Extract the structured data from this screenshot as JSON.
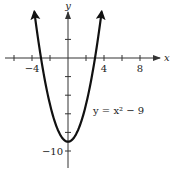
{
  "chart_data": {
    "type": "line",
    "title": "",
    "function": "y = x^2 - 9",
    "annotation": {
      "text": "y = x² − 9",
      "x": 93,
      "y": 114
    },
    "xlabel": "x",
    "ylabel": "y",
    "xlim": [
      -7,
      10
    ],
    "ylim": [
      -12,
      6
    ],
    "x_ticks": [
      -6,
      -4,
      -2,
      2,
      4,
      6,
      8
    ],
    "x_tick_labels": [
      {
        "value": -4,
        "label": "−4"
      },
      {
        "value": 4,
        "label": "4"
      },
      {
        "value": 8,
        "label": "8"
      }
    ],
    "y_ticks": [
      2,
      -2,
      -4,
      -6,
      -8,
      -10
    ],
    "y_tick_labels": [
      {
        "value": -10,
        "label": "−10"
      }
    ],
    "series": [
      {
        "name": "y = x² − 9",
        "x": [
          -3.74,
          -3,
          -2,
          -1,
          0,
          1,
          2,
          3,
          3.74
        ],
        "values": [
          5,
          0,
          -5,
          -8,
          -9,
          -8,
          -5,
          0,
          5
        ],
        "arrows_at_ends": true
      }
    ],
    "vertex": [
      0,
      -9
    ],
    "x_intercepts": [
      -3,
      3
    ],
    "grid": false,
    "legend": "none",
    "colors": {
      "curve": "#111111",
      "axes": "#333333"
    }
  },
  "layout": {
    "origin_px": [
      68,
      58
    ],
    "px_per_unit_x": 9,
    "px_per_unit_y": 9.3
  }
}
